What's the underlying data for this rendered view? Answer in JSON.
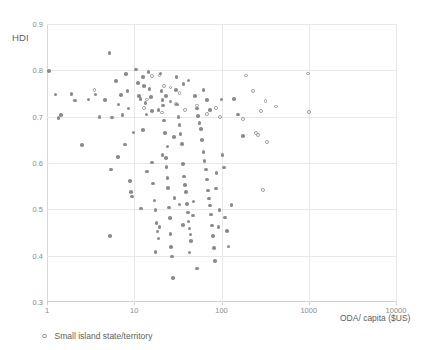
{
  "chart_data": {
    "type": "scatter",
    "title": "",
    "xlabel": "ODA/ capita ($US)",
    "ylabel": "HDI",
    "xscale": "log",
    "yscale": "linear",
    "xlim": [
      1,
      10000
    ],
    "ylim": [
      0.3,
      0.9
    ],
    "xticks": [
      "1",
      "10",
      "100",
      "1000",
      "10000"
    ],
    "xtick_values": [
      1,
      10,
      100,
      1000,
      10000
    ],
    "yticks": [
      "0.3",
      "0.4",
      "0.5",
      "0.6",
      "0.7",
      "0.8",
      "0.9"
    ],
    "ytick_values": [
      0.3,
      0.4,
      0.5,
      0.6,
      0.7,
      0.8,
      0.9
    ],
    "grid": true,
    "legend_position": "below-left",
    "marker_color": "#8b8b8b",
    "open_marker_color": "#9a9a9a",
    "gridline_color": "#e8e8e8",
    "legend": [
      {
        "label": "Small island state/territory",
        "marker": "open-circle"
      }
    ],
    "series": [
      {
        "name": "Countries",
        "marker": "filled-circle",
        "points": [
          [
            1.05,
            0.799
          ],
          [
            1.25,
            0.748
          ],
          [
            1.35,
            0.697
          ],
          [
            1.45,
            0.703
          ],
          [
            1.9,
            0.749
          ],
          [
            2.1,
            0.735
          ],
          [
            2.5,
            0.639
          ],
          [
            3.0,
            0.737
          ],
          [
            3.6,
            0.748
          ],
          [
            4.0,
            0.699
          ],
          [
            4.6,
            0.736
          ],
          [
            5.2,
            0.838
          ],
          [
            5.3,
            0.443
          ],
          [
            5.6,
            0.698
          ],
          [
            6.2,
            0.777
          ],
          [
            6.6,
            0.726
          ],
          [
            7.1,
            0.747
          ],
          [
            7.3,
            0.704
          ],
          [
            8.0,
            0.792
          ],
          [
            8.4,
            0.756
          ],
          [
            8.6,
            0.718
          ],
          [
            9.0,
            0.561
          ],
          [
            9.2,
            0.538
          ],
          [
            9.4,
            0.528
          ],
          [
            10.5,
            0.802
          ],
          [
            11.0,
            0.773
          ],
          [
            11.4,
            0.745
          ],
          [
            11.8,
            0.738
          ],
          [
            12.0,
            0.502
          ],
          [
            12.5,
            0.785
          ],
          [
            13.0,
            0.766
          ],
          [
            13.4,
            0.729
          ],
          [
            13.8,
            0.705
          ],
          [
            14.0,
            0.582
          ],
          [
            14.5,
            0.796
          ],
          [
            15.0,
            0.76
          ],
          [
            15.5,
            0.742
          ],
          [
            16.0,
            0.601
          ],
          [
            16.5,
            0.556
          ],
          [
            17.0,
            0.519
          ],
          [
            17.5,
            0.498
          ],
          [
            18.0,
            0.47
          ],
          [
            18.5,
            0.452
          ],
          [
            19.0,
            0.437
          ],
          [
            19.5,
            0.462
          ],
          [
            20.0,
            0.793
          ],
          [
            20.5,
            0.756
          ],
          [
            21.0,
            0.736
          ],
          [
            21.5,
            0.724
          ],
          [
            22.0,
            0.692
          ],
          [
            22.5,
            0.665
          ],
          [
            23.0,
            0.611
          ],
          [
            23.5,
            0.592
          ],
          [
            24.0,
            0.567
          ],
          [
            24.5,
            0.546
          ],
          [
            25.0,
            0.504
          ],
          [
            25.5,
            0.481
          ],
          [
            26.0,
            0.447
          ],
          [
            26.5,
            0.419
          ],
          [
            27.0,
            0.398
          ],
          [
            28.0,
            0.352
          ],
          [
            29.0,
            0.524
          ],
          [
            30.0,
            0.757
          ],
          [
            31.0,
            0.726
          ],
          [
            32.0,
            0.699
          ],
          [
            33.0,
            0.682
          ],
          [
            34.0,
            0.663
          ],
          [
            35.0,
            0.641
          ],
          [
            36.0,
            0.598
          ],
          [
            37.0,
            0.571
          ],
          [
            38.0,
            0.552
          ],
          [
            39.0,
            0.537
          ],
          [
            40.0,
            0.512
          ],
          [
            41.0,
            0.493
          ],
          [
            42.0,
            0.474
          ],
          [
            43.0,
            0.459
          ],
          [
            44.0,
            0.446
          ],
          [
            45.0,
            0.432
          ],
          [
            47.0,
            0.487
          ],
          [
            48.0,
            0.517
          ],
          [
            50.0,
            0.745
          ],
          [
            52.0,
            0.718
          ],
          [
            54.0,
            0.701
          ],
          [
            56.0,
            0.686
          ],
          [
            58.0,
            0.673
          ],
          [
            60.0,
            0.649
          ],
          [
            62.0,
            0.624
          ],
          [
            64.0,
            0.604
          ],
          [
            66.0,
            0.586
          ],
          [
            68.0,
            0.564
          ],
          [
            70.0,
            0.541
          ],
          [
            72.0,
            0.523
          ],
          [
            74.0,
            0.508
          ],
          [
            76.0,
            0.489
          ],
          [
            78.0,
            0.465
          ],
          [
            80.0,
            0.442
          ],
          [
            82.0,
            0.416
          ],
          [
            84.0,
            0.388
          ],
          [
            86.0,
            0.545
          ],
          [
            88.0,
            0.578
          ],
          [
            92.0,
            0.462
          ],
          [
            95.0,
            0.498
          ],
          [
            100.0,
            0.737
          ],
          [
            103.0,
            0.617
          ],
          [
            106.0,
            0.59
          ],
          [
            110.0,
            0.482
          ],
          [
            115.0,
            0.453
          ],
          [
            120.0,
            0.42
          ],
          [
            130.0,
            0.509
          ],
          [
            140.0,
            0.738
          ],
          [
            155.0,
            0.705
          ],
          [
            175.0,
            0.658
          ],
          [
            42.0,
            0.778
          ],
          [
            36.5,
            0.77
          ],
          [
            30.5,
            0.786
          ],
          [
            26.0,
            0.733
          ],
          [
            23.0,
            0.745
          ],
          [
            19.0,
            0.715
          ],
          [
            16.0,
            0.712
          ],
          [
            12.5,
            0.671
          ],
          [
            9.8,
            0.666
          ],
          [
            7.8,
            0.64
          ],
          [
            6.5,
            0.613
          ],
          [
            5.4,
            0.586
          ],
          [
            62.0,
            0.757
          ],
          [
            68.0,
            0.736
          ],
          [
            74.0,
            0.714
          ],
          [
            21.0,
            0.617
          ],
          [
            24.0,
            0.636
          ],
          [
            28.5,
            0.656
          ],
          [
            33.0,
            0.51
          ],
          [
            36.0,
            0.466
          ],
          [
            43.0,
            0.407
          ],
          [
            52.0,
            0.372
          ],
          [
            17.5,
            0.408
          ]
        ]
      },
      {
        "name": "Small island state/territory",
        "marker": "open-circle",
        "points": [
          [
            3.5,
            0.758
          ],
          [
            16.0,
            0.788
          ],
          [
            19.5,
            0.789
          ],
          [
            22.0,
            0.766
          ],
          [
            26.0,
            0.763
          ],
          [
            33.0,
            0.751
          ],
          [
            21.0,
            0.709
          ],
          [
            38.0,
            0.714
          ],
          [
            52.0,
            0.724
          ],
          [
            68.0,
            0.705
          ],
          [
            30.0,
            0.728
          ],
          [
            14.0,
            0.737
          ],
          [
            13.0,
            0.718
          ],
          [
            190.0,
            0.789
          ],
          [
            230.0,
            0.756
          ],
          [
            320.0,
            0.734
          ],
          [
            420.0,
            0.722
          ],
          [
            285.0,
            0.712
          ],
          [
            250.0,
            0.665
          ],
          [
            260.0,
            0.66
          ],
          [
            175.0,
            0.695
          ],
          [
            330.0,
            0.646
          ],
          [
            300.0,
            0.542
          ],
          [
            990.0,
            0.793
          ],
          [
            1000.0,
            0.71
          ],
          [
            96.0,
            0.7
          ],
          [
            86.0,
            0.718
          ]
        ]
      }
    ]
  },
  "axes": {
    "y_title": "HDI",
    "x_title": "ODA/ capita ($US)"
  },
  "legend": {
    "entry_label": "Small island state/territory"
  }
}
